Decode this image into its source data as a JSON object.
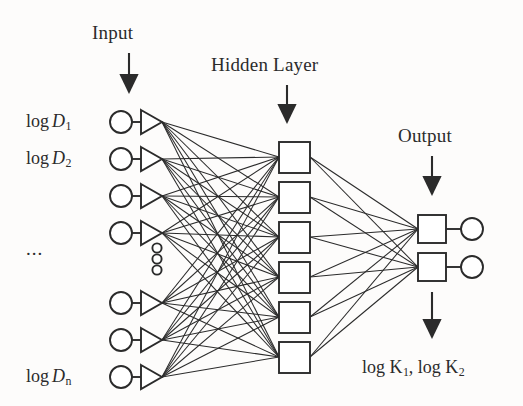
{
  "diagram": {
    "background_color": "#fdfcfb",
    "stroke_color": "#2b2b2b",
    "node_fill_color": "#ffffff",
    "sections": {
      "input_label": "Input",
      "hidden_label": "Hidden Layer",
      "output_label": "Output"
    },
    "input_nodes": [
      {
        "label_prefix": "log",
        "variable": "D",
        "subscript": "1",
        "y": 122
      },
      {
        "label_prefix": "log",
        "variable": "D",
        "subscript": "2",
        "y": 159
      },
      {
        "label_prefix": "",
        "variable": "",
        "subscript": "",
        "y": 196
      },
      {
        "label_prefix": "",
        "variable": "",
        "subscript": "",
        "y": 233
      },
      {
        "label_prefix": "",
        "variable": "",
        "subscript": "",
        "y": 303
      },
      {
        "label_prefix": "",
        "variable": "",
        "subscript": "",
        "y": 340
      },
      {
        "label_prefix": "log",
        "variable": "D",
        "subscript": "n",
        "y": 377
      }
    ],
    "input_ellipsis": "...",
    "input_vertical_dots_count": 3,
    "hidden_nodes_count": 6,
    "hidden_nodes_y": [
      142,
      182,
      222,
      262,
      302,
      342
    ],
    "output_nodes_count": 2,
    "output_nodes_y": [
      229,
      267
    ],
    "output_terms": {
      "first": {
        "prefix": "log",
        "variable": "K",
        "subscript": "1"
      },
      "second": {
        "prefix": "log",
        "variable": "K",
        "subscript": "2"
      },
      "separator": ", "
    }
  },
  "geometry": {
    "input_circle_cx": 121,
    "input_circle_r": 11,
    "input_triangle_x": 140,
    "input_triangle_w": 22,
    "input_triangle_h": 24,
    "hidden_square_x": 279,
    "hidden_square_size": 31,
    "output_square_x": 418,
    "output_square_size": 28,
    "output_circle_cx": 472,
    "output_circle_r": 11
  }
}
